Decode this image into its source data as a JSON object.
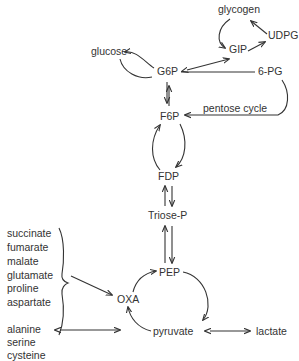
{
  "diagram": {
    "type": "metabolic-pathway",
    "nodes": {
      "glycogen": "glycogen",
      "udpg": "UDPG",
      "gip": "GIP",
      "glucose": "glucose",
      "g6p": "G6P",
      "pg6": "6-PG",
      "pentose_cycle": "pentose cycle",
      "f6p": "F6P",
      "fdp": "FDP",
      "triose_p": "Triose-P",
      "pep": "PEP",
      "oxa": "OXA",
      "pyruvate": "pyruvate",
      "lactate": "lactate"
    },
    "oxa_precursors": [
      "succinate",
      "fumarate",
      "malate",
      "glutamate",
      "proline",
      "aspartate"
    ],
    "pyruvate_precursors": [
      "alanine",
      "serine",
      "cysteine"
    ],
    "edges": [
      {
        "from": "glycogen",
        "to": "GIP"
      },
      {
        "from": "UDPG",
        "to": "glycogen"
      },
      {
        "from": "GIP",
        "to": "UDPG"
      },
      {
        "from": "G6P",
        "to": "GIP",
        "bidirectional": true
      },
      {
        "from": "G6P",
        "to": "glucose"
      },
      {
        "from": "G6P",
        "to": "6-PG"
      },
      {
        "from": "6-PG",
        "to": "F6P",
        "label": "pentose cycle"
      },
      {
        "from": "G6P",
        "to": "F6P",
        "bidirectional": true
      },
      {
        "from": "F6P",
        "to": "FDP"
      },
      {
        "from": "FDP",
        "to": "F6P"
      },
      {
        "from": "FDP",
        "to": "Triose-P",
        "bidirectional": true
      },
      {
        "from": "Triose-P",
        "to": "PEP",
        "bidirectional": true
      },
      {
        "from": "PEP",
        "to": "pyruvate"
      },
      {
        "from": "pyruvate",
        "to": "OXA"
      },
      {
        "from": "OXA",
        "to": "PEP"
      },
      {
        "from": "amino/organic acids group",
        "to": "OXA"
      },
      {
        "from": "pyruvate",
        "to": "lactate",
        "bidirectional": true
      },
      {
        "from": "pyruvate",
        "to": "alanine/serine/cysteine",
        "bidirectional": true
      }
    ]
  }
}
